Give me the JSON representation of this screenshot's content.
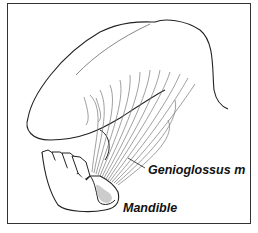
{
  "figure": {
    "labels": {
      "genioglossus": "Genioglossus m",
      "mandible": "Mandible"
    },
    "colors": {
      "outline": "#222222",
      "fibers": "#777777",
      "bone_fill": "#cccccc",
      "border": "#333333"
    }
  }
}
